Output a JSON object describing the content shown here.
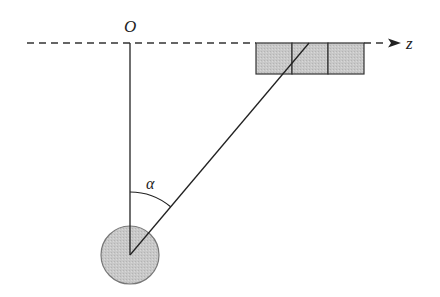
{
  "diagram": {
    "type": "pendulum-geometry",
    "labels": {
      "origin": "O",
      "axis": "z",
      "angle": "α"
    },
    "axis": {
      "style": "dashed",
      "direction": "right",
      "y": 43
    },
    "boxes": {
      "count": 3,
      "fill": "#c8c8c8",
      "stroke": "#333333"
    },
    "bob": {
      "shape": "circle",
      "fill": "#cfcfcf",
      "stroke": "#666666"
    },
    "colors": {
      "line": "#222222",
      "background": "#ffffff"
    }
  }
}
